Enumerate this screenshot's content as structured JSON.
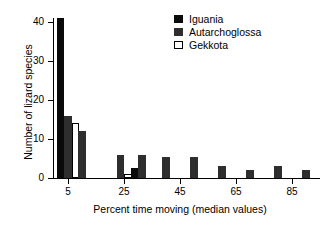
{
  "chart_data": {
    "type": "bar",
    "title": "",
    "xlabel": "Percent time moving (median values)",
    "ylabel": "Number of lizard species",
    "xlim": [
      0,
      95
    ],
    "ylim": [
      0,
      41
    ],
    "grid": false,
    "legend_position": "top-right",
    "xtick_labels": [
      "5",
      "25",
      "45",
      "65",
      "85"
    ],
    "xtick_values": [
      5,
      25,
      45,
      65,
      85
    ],
    "ytick_labels": [
      "0",
      "10",
      "20",
      "30",
      "40"
    ],
    "ytick_values": [
      0,
      10,
      20,
      30,
      40
    ],
    "categories": [
      5,
      10,
      15,
      20,
      25,
      30,
      35,
      40,
      45,
      50,
      55,
      60,
      65,
      70,
      75,
      80,
      85,
      90
    ],
    "series": [
      {
        "name": "Iguania",
        "color": "#0a0a0a",
        "values": [
          41,
          0,
          0,
          0,
          0,
          2.5,
          0,
          0,
          0,
          0,
          0,
          0,
          0,
          0,
          0,
          0,
          0,
          0
        ]
      },
      {
        "name": "Autarchoglossa",
        "color": "#2e2e2e",
        "values": [
          16,
          12,
          0,
          0,
          6,
          6,
          0,
          5.5,
          0,
          5.5,
          0,
          3,
          0,
          2,
          0,
          3,
          0,
          2
        ]
      },
      {
        "name": "Gekkota",
        "color": "#ffffff",
        "values": [
          14,
          0,
          0,
          0,
          1,
          0,
          0,
          0,
          0,
          0,
          0,
          0,
          0,
          0,
          0,
          0,
          0,
          0
        ]
      }
    ]
  },
  "legend": {
    "items": [
      {
        "label": "Iguania",
        "swatch": "iguania"
      },
      {
        "label": "Autarchoglossa",
        "swatch": "autarchoglossa"
      },
      {
        "label": "Gekkota",
        "swatch": "gekkota"
      }
    ]
  }
}
